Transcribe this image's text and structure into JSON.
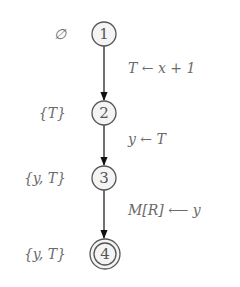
{
  "diagram": {
    "type": "state-flow-graph",
    "nodes": [
      {
        "id": "1",
        "label": "1",
        "set": "∅",
        "accepting": false
      },
      {
        "id": "2",
        "label": "2",
        "set": "{T}",
        "accepting": false
      },
      {
        "id": "3",
        "label": "3",
        "set": "{y, T}",
        "accepting": false
      },
      {
        "id": "4",
        "label": "4",
        "set": "{y, T}",
        "accepting": true
      }
    ],
    "edges": [
      {
        "from": "1",
        "to": "2",
        "label": "T ← x + 1"
      },
      {
        "from": "2",
        "to": "3",
        "label": "y ← T"
      },
      {
        "from": "3",
        "to": "4",
        "label": "M[R] ⟵ y"
      }
    ]
  }
}
